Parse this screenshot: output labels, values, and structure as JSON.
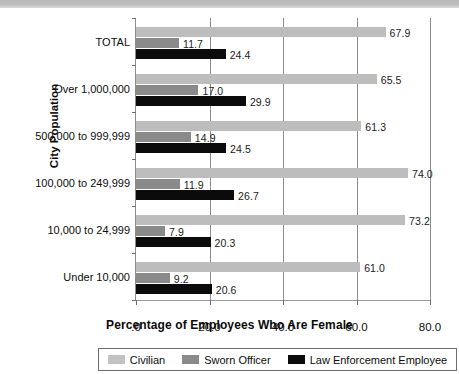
{
  "chart_data": {
    "type": "bar",
    "orientation": "horizontal",
    "title": "",
    "xlabel": "Percentage of Employees Who Are Female",
    "ylabel": "City Population",
    "xlim": [
      0,
      80
    ],
    "xticks": [
      ".0",
      "20.0",
      "40.0",
      "60.0",
      "80.0"
    ],
    "xtick_values": [
      0,
      20,
      40,
      60,
      80
    ],
    "grid": true,
    "legend_position": "bottom",
    "categories": [
      "TOTAL",
      "Over 1,000,000",
      "500,000 to 999,999",
      "100,000 to 249,999",
      "10,000 to 24,999",
      "Under 10,000"
    ],
    "series": [
      {
        "name": "Civilian",
        "color": "#bdbdbd",
        "values": [
          67.9,
          65.5,
          61.3,
          74.0,
          73.2,
          61.0
        ],
        "labels": [
          "67.9",
          "65.5",
          "61.3",
          "74.0",
          "73.2",
          "61.0"
        ]
      },
      {
        "name": "Sworn Officer",
        "color": "#8a8a8a",
        "values": [
          11.7,
          17.0,
          14.9,
          11.9,
          7.9,
          9.2
        ],
        "labels": [
          "11.7",
          "17.0",
          "14.9",
          "11.9",
          "7.9",
          "9.2"
        ]
      },
      {
        "name": "Law Enforcement Employee",
        "color": "#0b0b0b",
        "values": [
          24.4,
          29.9,
          24.5,
          26.7,
          20.3,
          20.6
        ],
        "labels": [
          "24.4",
          "29.9",
          "24.5",
          "26.7",
          "20.3",
          "20.6"
        ]
      }
    ]
  },
  "legend": {
    "items": [
      {
        "label": "Civilian",
        "color": "#bdbdbd"
      },
      {
        "label": "Sworn Officer",
        "color": "#8a8a8a"
      },
      {
        "label": "Law Enforcement Employee",
        "color": "#0b0b0b"
      }
    ]
  }
}
